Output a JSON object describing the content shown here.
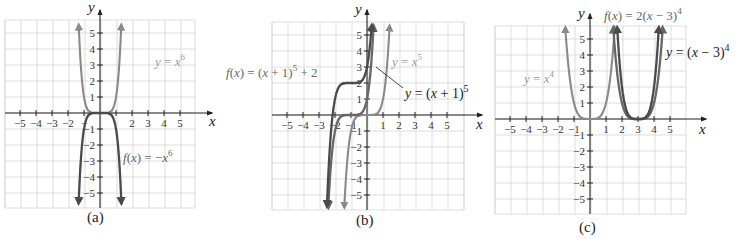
{
  "chart_data": [
    {
      "type": "line",
      "panel_label": "(a)",
      "xlabel": "x",
      "ylabel": "y",
      "xlim": [
        -5,
        5
      ],
      "ylim": [
        -5,
        5
      ],
      "grid": true,
      "x_ticks": [
        "−5",
        "−4",
        "−3",
        "−2",
        "−",
        "2",
        "3",
        "4",
        "5"
      ],
      "y_ticks_pos": [
        "1",
        "2",
        "3",
        "4",
        "5"
      ],
      "y_ticks_neg": [
        "1",
        "2",
        "3",
        "4",
        "5"
      ],
      "series": [
        {
          "name": "y = x^6",
          "label_text": "y = x",
          "label_exp": "6",
          "func": "x^6",
          "style": "light"
        },
        {
          "name": "f(x) = -x^6",
          "label_text": "f(x) = −x",
          "label_exp": "6",
          "func": "-x^6",
          "style": "dark"
        }
      ]
    },
    {
      "type": "line",
      "panel_label": "(b)",
      "xlabel": "x",
      "ylabel": "y",
      "xlim": [
        -5,
        5
      ],
      "ylim": [
        -5,
        5
      ],
      "grid": true,
      "x_ticks": [
        "−5",
        "−4",
        "−3",
        "−2",
        "−1",
        "1",
        "2",
        "3",
        "4",
        "5"
      ],
      "y_ticks_pos": [
        "1",
        "2",
        "3",
        "4",
        "5"
      ],
      "y_ticks_neg": [
        "1",
        "2",
        "3",
        "4",
        "5"
      ],
      "series": [
        {
          "name": "y = x^5",
          "label_text": "y = x",
          "label_exp": "5",
          "func": "x^5",
          "style": "light"
        },
        {
          "name": "y = (x + 1)^5",
          "label_text": "y = (x + 1)",
          "label_exp": "5",
          "func": "(x+1)^5",
          "style": "mid"
        },
        {
          "name": "f(x) = (x + 1)^5 + 2",
          "label_text": "f(x) = (x + 1)",
          "label_exp": "5",
          "label_suffix": " + 2",
          "func": "(x+1)^5+2",
          "style": "dark"
        }
      ]
    },
    {
      "type": "line",
      "panel_label": "(c)",
      "xlabel": "x",
      "ylabel": "y",
      "xlim": [
        -5,
        5
      ],
      "ylim": [
        -5,
        5
      ],
      "grid": true,
      "x_ticks": [
        "−5",
        "−4",
        "−3",
        "−2",
        "−1",
        "1",
        "2",
        "3",
        "4",
        "5"
      ],
      "y_ticks_pos": [
        "1",
        "2",
        "3",
        "4",
        "5"
      ],
      "y_ticks_neg": [
        "1",
        "2",
        "3",
        "4",
        "5"
      ],
      "series": [
        {
          "name": "y = x^4",
          "label_text": "y = x",
          "label_exp": "4",
          "func": "x^4",
          "style": "light"
        },
        {
          "name": "y = (x − 3)^4",
          "label_text": "y = (x − 3)",
          "label_exp": "4",
          "func": "(x-3)^4",
          "style": "mid"
        },
        {
          "name": "f(x) = 2(x − 3)^4",
          "label_text": "f(x) = 2(x − 3)",
          "label_exp": "4",
          "func": "2(x-3)^4",
          "style": "dark"
        }
      ]
    }
  ]
}
